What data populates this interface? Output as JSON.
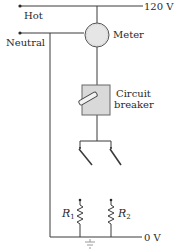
{
  "diagram": {
    "type": "household circuit schematic",
    "labels": {
      "hot": "Hot",
      "neutral": "Neutral",
      "hot_voltage": "120 V",
      "ground_voltage": "0 V",
      "meter": "Meter",
      "breaker_line1": "Circuit",
      "breaker_line2": "breaker",
      "r1": "R",
      "r1_sub": "1",
      "r2": "R",
      "r2_sub": "2"
    },
    "colors": {
      "line": "#3a3a3a",
      "meter_fill": "#e6e6e6",
      "breaker_fill": "#d9d9d9",
      "text": "#2a2a2a"
    }
  }
}
